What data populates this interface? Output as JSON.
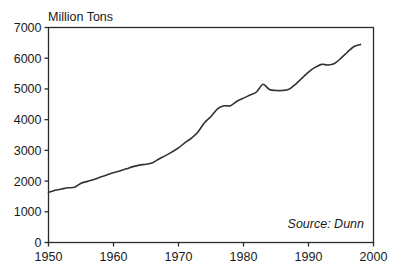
{
  "chart_data": {
    "type": "line",
    "title": "Million Tons",
    "xlabel": "",
    "ylabel": "Million Tons",
    "annotation": "Source: Dunn",
    "grid": false,
    "legend": "none",
    "xlim": [
      1950,
      2000
    ],
    "ylim": [
      0,
      7000
    ],
    "x_ticks": [
      "1950",
      "1960",
      "1970",
      "1980",
      "1990",
      "2000"
    ],
    "x_tick_values": [
      1950,
      1960,
      1970,
      1980,
      1990,
      2000
    ],
    "y_ticks": [
      "0",
      "1000",
      "2000",
      "3000",
      "4000",
      "5000",
      "6000",
      "7000"
    ],
    "y_tick_values": [
      0,
      1000,
      2000,
      3000,
      4000,
      5000,
      6000,
      7000
    ],
    "series": [
      {
        "name": "Production",
        "x": [
          1950,
          1951,
          1952,
          1953,
          1954,
          1955,
          1956,
          1957,
          1958,
          1959,
          1960,
          1961,
          1962,
          1963,
          1964,
          1965,
          1966,
          1967,
          1968,
          1969,
          1970,
          1971,
          1972,
          1973,
          1974,
          1975,
          1976,
          1977,
          1978,
          1979,
          1980,
          1981,
          1982,
          1983,
          1984,
          1985,
          1986,
          1987,
          1988,
          1989,
          1990,
          1991,
          1992,
          1993,
          1994,
          1995,
          1996,
          1997,
          1998
        ],
        "values": [
          1630,
          1700,
          1740,
          1780,
          1800,
          1930,
          1990,
          2050,
          2130,
          2200,
          2270,
          2330,
          2400,
          2470,
          2520,
          2550,
          2600,
          2720,
          2830,
          2950,
          3080,
          3250,
          3400,
          3600,
          3900,
          4100,
          4350,
          4450,
          4450,
          4600,
          4700,
          4800,
          4900,
          5150,
          4980,
          4950,
          4950,
          4990,
          5150,
          5350,
          5550,
          5700,
          5800,
          5780,
          5830,
          6000,
          6200,
          6380,
          6450
        ]
      }
    ]
  },
  "axis": {
    "y_title": "Million Tons",
    "source": "Source: Dunn"
  }
}
